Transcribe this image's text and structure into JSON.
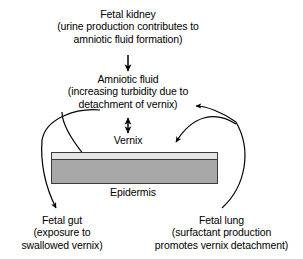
{
  "diagram": {
    "nodes": {
      "fetal_kidney": {
        "line1": "Fetal kidney",
        "line2": "(urine production contributes to",
        "line3": "amniotic fluid formation)"
      },
      "amniotic_fluid": {
        "line1": "Amniotic fluid",
        "line2": "(increasing turbidity due to",
        "line3": "detachment of vernix)"
      },
      "vernix": {
        "line1": "Vernix"
      },
      "epidermis": {
        "line1": "Epidermis"
      },
      "fetal_gut": {
        "line1": "Fetal gut",
        "line2": "(exposure to",
        "line3": "swallowed vernix)"
      },
      "fetal_lung": {
        "line1": "Fetal lung",
        "line2": "(surfactant production",
        "line3": "promotes vernix detachment)"
      }
    },
    "colors": {
      "stroke": "#000000",
      "epidermis_fill": "#a8a8a8",
      "vernix_fill": "#e4e4e4",
      "block_border": "#3a3a3a",
      "background": "#ffffff"
    }
  }
}
